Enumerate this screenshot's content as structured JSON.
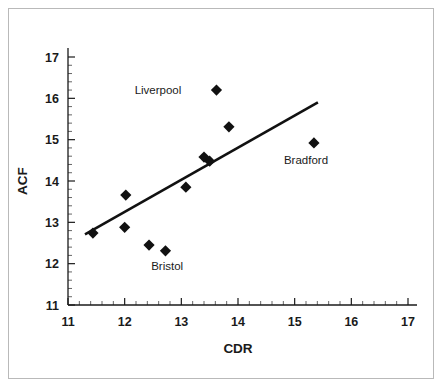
{
  "chart_data": {
    "type": "scatter",
    "title": "",
    "xlabel": "CDR",
    "ylabel": "ACF",
    "xlim": [
      11,
      17
    ],
    "ylim": [
      11,
      17
    ],
    "xticks": [
      11,
      12,
      13,
      14,
      15,
      16,
      17
    ],
    "yticks": [
      11,
      12,
      13,
      14,
      15,
      16,
      17
    ],
    "xtick_labels": [
      "11",
      "12",
      "13",
      "14",
      "15",
      "16",
      "17"
    ],
    "ytick_labels": [
      "11",
      "12",
      "13",
      "14",
      "15",
      "16",
      "17"
    ],
    "minor_tick_step": 0.2,
    "grid": false,
    "legend": "none",
    "marker_shape": "diamond",
    "marker_color": "#111111",
    "points": [
      {
        "x": 11.44,
        "y": 12.74,
        "label": ""
      },
      {
        "x": 12.0,
        "y": 12.88,
        "label": ""
      },
      {
        "x": 12.02,
        "y": 13.66,
        "label": ""
      },
      {
        "x": 12.43,
        "y": 12.45,
        "label": ""
      },
      {
        "x": 12.72,
        "y": 12.31,
        "label": ""
      },
      {
        "x": 13.08,
        "y": 13.85,
        "label": ""
      },
      {
        "x": 13.4,
        "y": 14.58,
        "label": ""
      },
      {
        "x": 13.5,
        "y": 14.48,
        "label": ""
      },
      {
        "x": 13.62,
        "y": 16.2,
        "label": "Liverpool"
      },
      {
        "x": 13.84,
        "y": 15.31,
        "label": ""
      },
      {
        "x": 15.34,
        "y": 14.92,
        "label": "Bradford"
      }
    ],
    "annotations": [
      {
        "text": "Liverpool",
        "x": 13.0,
        "y": 16.2,
        "anchor": "end"
      },
      {
        "text": "Bradford",
        "x": 15.2,
        "y": 14.52,
        "anchor": "middle"
      },
      {
        "text": "Bristol",
        "x": 12.75,
        "y": 11.95,
        "anchor": "middle"
      }
    ],
    "trendline": {
      "type": "linear-fit",
      "x0": 11.3,
      "y0": 12.71,
      "x1": 15.41,
      "y1": 15.9
    }
  },
  "figure": {
    "border_color": "#b9b9b9",
    "background": "#ffffff",
    "axis_color": "#1a1a1a"
  }
}
